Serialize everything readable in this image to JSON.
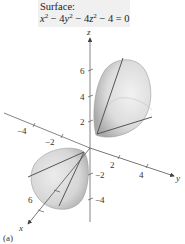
{
  "caption": {
    "title": "Surface:",
    "equation": {
      "terms": [
        "x",
        "2",
        " − 4",
        "y",
        "2",
        " − 4",
        "z",
        "2",
        " − 4 = 0"
      ],
      "text": "x² − 4y² − 4z² − 4 = 0"
    }
  },
  "axes": {
    "x": {
      "label": "x",
      "ticks": [
        {
          "value": "6",
          "label": "6"
        }
      ]
    },
    "y": {
      "label": "y",
      "ticks": [
        {
          "value": "-4",
          "label": "−4"
        },
        {
          "value": "-2",
          "label": "−2"
        },
        {
          "value": "2",
          "label": "2"
        },
        {
          "value": "4",
          "label": "4"
        }
      ]
    },
    "z": {
      "label": "z",
      "ticks": [
        {
          "value": "6",
          "label": "6"
        },
        {
          "value": "4",
          "label": "4"
        },
        {
          "value": "2",
          "label": "2"
        },
        {
          "value": "-2",
          "label": "−2"
        },
        {
          "value": "-4",
          "label": "−4"
        }
      ]
    }
  },
  "surface": {
    "type": "hyperboloid of two sheets",
    "fill_light": "#e6e6e6",
    "fill_dark": "#a9a9a9",
    "trace_color": "#555555"
  },
  "part_label": "(a)"
}
